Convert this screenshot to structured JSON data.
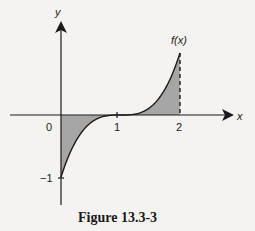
{
  "chart_data": {
    "type": "area",
    "title": "",
    "caption": "Figure 13.3-3",
    "function_label": "f(x)",
    "function": "(x-1)^3",
    "xlabel": "x",
    "ylabel": "y",
    "x_ticks": [
      "0",
      "1",
      "2"
    ],
    "y_ticks": [
      "−1"
    ],
    "x": [
      0,
      0.25,
      0.5,
      0.75,
      1,
      1.25,
      1.5,
      1.75,
      2
    ],
    "y": [
      -1,
      -0.42,
      -0.125,
      -0.016,
      0,
      0.016,
      0.125,
      0.42,
      1
    ],
    "shaded_region": {
      "from": 0,
      "to": 2,
      "description": "area between curve and x-axis"
    },
    "dashed_line_at_x": 2,
    "xlim": [
      -0.85,
      2.85
    ],
    "ylim": [
      -1.45,
      1.5
    ],
    "grid": false,
    "legend": null,
    "colors": {
      "fill": "#a6a6a6",
      "line": "#1a1a1a",
      "background": "#f4f3f1"
    }
  }
}
